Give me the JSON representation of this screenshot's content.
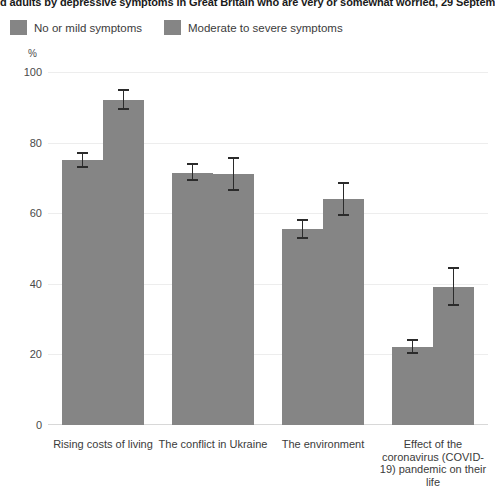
{
  "title": "d adults by depressive symptoms in Great Britain who are very or somewhat worried, 29 September t",
  "legend": {
    "items": [
      {
        "label": "No or mild symptoms",
        "color": "#858585"
      },
      {
        "label": "Moderate to severe symptoms",
        "color": "#858585"
      }
    ]
  },
  "axis": {
    "unit": "%",
    "yticks": [
      "0",
      "20",
      "40",
      "60",
      "80",
      "100"
    ]
  },
  "chart_data": {
    "type": "bar",
    "title": "d adults by depressive symptoms in Great Britain who are very or somewhat worried, 29 September t",
    "xlabel": "",
    "ylabel": "%",
    "ylim": [
      0,
      100
    ],
    "grid": true,
    "legend_position": "top-left",
    "error_bars": "95% confidence interval",
    "categories": [
      "Rising costs of living",
      "The conflict in Ukraine",
      "The environment",
      "Effect of the coronavirus (COVID-19) pandemic on their life"
    ],
    "series": [
      {
        "name": "No or mild symptoms",
        "color": "#858585",
        "values": [
          75,
          71.5,
          55.5,
          22
        ],
        "ci_low": [
          73,
          69.5,
          53,
          20.5
        ],
        "ci_high": [
          77,
          74,
          58,
          24
        ]
      },
      {
        "name": "Moderate to severe symptoms",
        "color": "#858585",
        "values": [
          92,
          71,
          64,
          39
        ],
        "ci_low": [
          89.5,
          66.5,
          59.5,
          34
        ],
        "ci_high": [
          95,
          75.5,
          68.5,
          44.5
        ]
      }
    ]
  }
}
